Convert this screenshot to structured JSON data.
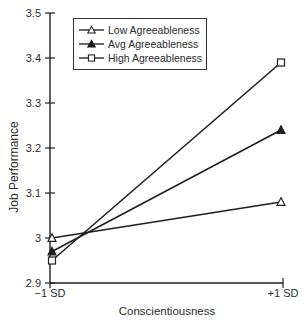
{
  "figure": {
    "background": "#ffffff",
    "line_color": "#1f1f1f",
    "text_color": "#2b2b2b"
  },
  "chart_data": {
    "type": "line",
    "title": "",
    "xlabel": "Conscientiousness",
    "ylabel": "Job Performance",
    "x_tick_labels": [
      "−1 SD",
      "+1 SD"
    ],
    "ylim": [
      2.9,
      3.5
    ],
    "y_ticks": [
      2.9,
      3.0,
      3.1,
      3.2,
      3.3,
      3.4,
      3.5
    ],
    "y_tick_labels": [
      "2.9",
      "3",
      "3.1",
      "3.2",
      "3.3",
      "3.4",
      "3.5"
    ],
    "grid": false,
    "legend": {
      "position": "top-left-inside",
      "entries": [
        {
          "label": "Low Agreeableness",
          "marker": "open-triangle"
        },
        {
          "label": "Avg Agreeableness",
          "marker": "filled-triangle"
        },
        {
          "label": "High Agreeableness",
          "marker": "open-square"
        }
      ]
    },
    "series": [
      {
        "name": "Low Agreeableness",
        "marker": "open-triangle",
        "values": [
          3.0,
          3.08
        ]
      },
      {
        "name": "Avg Agreeableness",
        "marker": "filled-triangle",
        "values": [
          2.97,
          3.24
        ]
      },
      {
        "name": "High Agreeableness",
        "marker": "open-square",
        "values": [
          2.95,
          3.39
        ]
      }
    ]
  }
}
